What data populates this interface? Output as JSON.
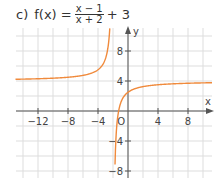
{
  "title": {
    "label": "c)",
    "function_name": "f(x) =",
    "numerator": "x − 1",
    "denominator": "x + 2",
    "suffix": "+ 3"
  },
  "chart_data": {
    "type": "line",
    "xlabel": "x",
    "ylabel": "y",
    "xlim": [
      -15,
      11
    ],
    "ylim": [
      -9,
      11
    ],
    "grid": true,
    "grid_step": 2,
    "x_ticks": [
      -12,
      -8,
      -4,
      4,
      8
    ],
    "y_ticks": [
      8,
      4,
      -4,
      -8
    ],
    "origin_label": "O",
    "series": [
      {
        "name": "f(x) = (x-1)/(x+2) + 3",
        "color": "#f08a3c",
        "vertical_asymptote": -2,
        "horizontal_asymptote": 4,
        "branch_left": {
          "x": [
            -15,
            -12,
            -8,
            -5,
            -4,
            -3,
            -2.5,
            -2.3
          ],
          "y": [
            4.23,
            4.3,
            4.5,
            5,
            5.5,
            7,
            10,
            14
          ]
        },
        "branch_right": {
          "x": [
            -1.65,
            -1.5,
            -1,
            0,
            2,
            4,
            8,
            11
          ],
          "y": [
            -4.57,
            -2,
            1,
            2.5,
            3.25,
            3.5,
            3.7,
            3.77
          ]
        }
      }
    ]
  },
  "colors": {
    "curve": "#f08a3c",
    "axis": "#555555",
    "grid": "#dddddd"
  }
}
